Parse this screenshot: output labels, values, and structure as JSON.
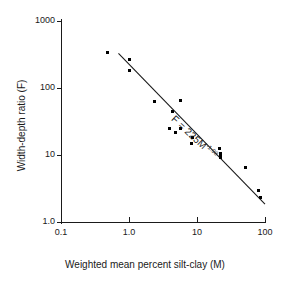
{
  "chart_data": {
    "type": "scatter",
    "title": "",
    "xlabel": "Weighted mean percent silt-clay (M)",
    "ylabel": "Width-depth ratio (F)",
    "xscale": "log",
    "yscale": "log",
    "xlim": [
      0.1,
      100
    ],
    "ylim": [
      1.0,
      1000
    ],
    "grid": false,
    "legend": null,
    "xticks": [
      "0.1",
      "1.0",
      "10",
      "100"
    ],
    "xtick_values": [
      0.1,
      1.0,
      10,
      100
    ],
    "yticks": [
      "1.0",
      "10",
      "100",
      "1000"
    ],
    "ytick_values": [
      1.0,
      10,
      100,
      1000
    ],
    "marker": "square",
    "marker_color": "#000000",
    "line_color": "#1a1a1a",
    "points": [
      {
        "x": 0.48,
        "y": 340
      },
      {
        "x": 1.0,
        "y": 265
      },
      {
        "x": 1.0,
        "y": 180
      },
      {
        "x": 2.4,
        "y": 63
      },
      {
        "x": 5.7,
        "y": 66
      },
      {
        "x": 4.3,
        "y": 45
      },
      {
        "x": 4.0,
        "y": 25
      },
      {
        "x": 4.8,
        "y": 22
      },
      {
        "x": 5.8,
        "y": 25
      },
      {
        "x": 8.5,
        "y": 18
      },
      {
        "x": 8.3,
        "y": 15
      },
      {
        "x": 21.5,
        "y": 12.5
      },
      {
        "x": 22.0,
        "y": 10.6
      },
      {
        "x": 21.8,
        "y": 9.8
      },
      {
        "x": 22.2,
        "y": 9.2
      },
      {
        "x": 52.0,
        "y": 6.5
      },
      {
        "x": 80.0,
        "y": 3.0
      },
      {
        "x": 86.0,
        "y": 2.3
      }
    ],
    "fit": {
      "label": "F = 225M",
      "exponent": "-1.08",
      "coefficient": 225,
      "power": -1.08,
      "x_start": 0.7,
      "x_end": 100,
      "y_start": 330,
      "y_end": 1.85
    },
    "annotations": [
      {
        "text": "F = 225M",
        "superscript": "-1.08",
        "rotation_deg": 43
      }
    ]
  }
}
